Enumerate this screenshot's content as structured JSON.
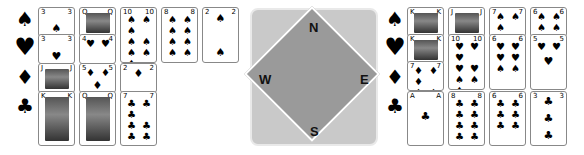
{
  "compass": {
    "north": "N",
    "south": "S",
    "east": "E",
    "west": "W"
  },
  "suits": {
    "spades": "♠",
    "hearts": "♥",
    "diamonds": "♦",
    "clubs": "♣"
  },
  "left_hand": {
    "spades": [
      "3",
      "Q",
      "10",
      "8",
      "2"
    ],
    "hearts": [
      "3",
      "4"
    ],
    "diamonds": [
      "J",
      "5",
      "2"
    ],
    "clubs": [
      "K",
      "Q",
      "7"
    ]
  },
  "right_hand": {
    "spades": [
      "K",
      "J",
      "7",
      "6"
    ],
    "hearts": [
      "K",
      "10",
      "6",
      "5"
    ],
    "diamonds": [
      "7"
    ],
    "clubs": [
      "A",
      "8",
      "6",
      "3"
    ]
  },
  "colors": {
    "compass_outer": "#c9c9c9",
    "compass_inner": "#9a9a9a",
    "card_border": "#888888"
  }
}
